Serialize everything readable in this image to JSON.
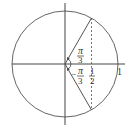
{
  "diagram": {
    "labels": {
      "upper_angle_num": "π",
      "upper_angle_den": "3",
      "lower_angle_sign": "−",
      "lower_angle_num": "π",
      "lower_angle_den": "3",
      "half_num": "1",
      "half_den": "2",
      "one": "1"
    },
    "angles_rad": [
      "π/3",
      "−π/3"
    ],
    "projection_x": "1/2",
    "radius": 1,
    "colors": {
      "stroke": "#555555",
      "text": "#333333"
    }
  }
}
